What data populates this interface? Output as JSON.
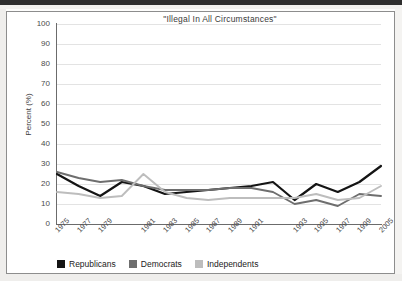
{
  "chart_data": {
    "type": "line",
    "title": "\"Illegal In All Circumstances\"",
    "xlabel": "",
    "ylabel": "Percent (%)",
    "ylim": [
      0,
      100
    ],
    "yticks": [
      0,
      10,
      20,
      30,
      40,
      50,
      60,
      70,
      80,
      90,
      100
    ],
    "grid": true,
    "legend_position": "bottom",
    "categories": [
      "1975",
      "1977",
      "1979",
      "1980",
      "1981",
      "1983",
      "1985",
      "1987",
      "1989",
      "1991",
      "1992",
      "1993",
      "1995",
      "1997",
      "1999",
      "2005"
    ],
    "tick_labels": [
      "1975",
      "1977",
      "1979",
      "1981",
      "1983",
      "1985",
      "1987",
      "1989",
      "1991",
      "1993",
      "1995",
      "1997",
      "1999",
      "2005"
    ],
    "series": [
      {
        "name": "Republicans",
        "color": "#141414",
        "values": [
          25,
          19,
          14,
          21,
          19,
          15,
          16,
          17,
          18,
          19,
          21,
          12,
          20,
          16,
          21,
          29
        ]
      },
      {
        "name": "Democrats",
        "color": "#6e6e6e",
        "values": [
          26,
          23,
          21,
          22,
          19,
          17,
          17,
          17,
          18,
          18,
          16,
          10,
          12,
          9,
          15,
          14
        ]
      },
      {
        "name": "Independents",
        "color": "#bdbdbd",
        "values": [
          16,
          15,
          13,
          14,
          25,
          16,
          13,
          12,
          13,
          13,
          13,
          13,
          15,
          12,
          13,
          19
        ]
      }
    ]
  },
  "legend": {
    "items": [
      {
        "label": "Republicans",
        "color": "#141414"
      },
      {
        "label": "Democrats",
        "color": "#6e6e6e"
      },
      {
        "label": "Independents",
        "color": "#bdbdbd"
      }
    ]
  }
}
